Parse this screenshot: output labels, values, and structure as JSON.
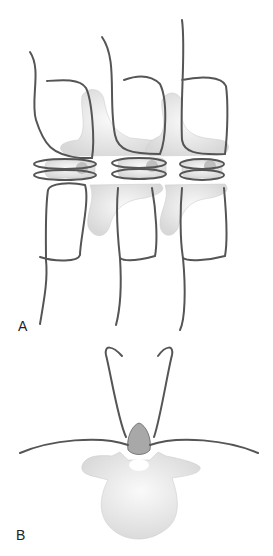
{
  "figure": {
    "panels": [
      {
        "label": "A",
        "description": "Posterior view of three vertebral levels with wire loops through spinous processes"
      },
      {
        "label": "B",
        "description": "Axial view of vertebra with wire passed through spinous process"
      }
    ],
    "colors": {
      "wire": "#555555",
      "bone": "#ececec",
      "bone_shadow": "#d2d2d2",
      "cancellous": "#9a9a9a"
    }
  }
}
